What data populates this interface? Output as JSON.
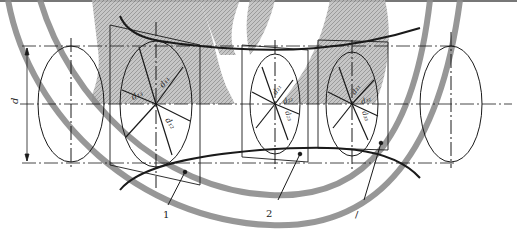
{
  "diagram": {
    "dimension_label": "d",
    "callouts": [
      {
        "id": "1",
        "label": "1"
      },
      {
        "id": "2",
        "label": "2"
      },
      {
        "id": "3",
        "label": "/"
      }
    ],
    "sections": [
      {
        "name": "section-1",
        "labels": {
          "upper_left": "d₁₃",
          "upper_right": "d₁₁",
          "lower": "d₁₂"
        }
      },
      {
        "name": "section-2",
        "labels": {
          "upper_right": "d₂₁",
          "mid": "d₂₂",
          "lower": "d₂₃"
        }
      },
      {
        "name": "section-3",
        "labels": {
          "upper_right": "d₃₁",
          "mid": "d₃₂",
          "lower": "d₃₃"
        }
      }
    ],
    "colors": {
      "line": "#1a1a1a",
      "hatch": "#9a9a9a",
      "watermark": "#8c8c8c",
      "background": "#ffffff"
    }
  }
}
